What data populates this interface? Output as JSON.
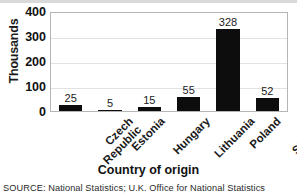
{
  "chart_data": {
    "type": "bar",
    "title": "",
    "categories": [
      "Czech Republic",
      "Estonia",
      "Hungary",
      "Lithuania",
      "Poland",
      "Slovakia"
    ],
    "category_lines": [
      [
        "Czech",
        "Republic"
      ],
      [
        "Estonia"
      ],
      [
        "Hungary"
      ],
      [
        "Lithuania"
      ],
      [
        "Poland"
      ],
      [
        "Slovakia"
      ]
    ],
    "values": [
      25,
      5,
      15,
      55,
      328,
      52
    ],
    "value_labels": [
      "25",
      "5",
      "15",
      "55",
      "328",
      "52"
    ],
    "xlabel": "Country of origin",
    "ylabel": "Thousands",
    "ylim": [
      0,
      400
    ],
    "yticks": [
      0,
      100,
      200,
      300,
      400
    ],
    "ytick_labels": [
      "0",
      "100",
      "200",
      "300",
      "400"
    ],
    "grid": true,
    "legend": false,
    "bar_color": "#0d0d0d",
    "plot_border_color": "#b5b5b5",
    "gridline_color": "#e2e2e2",
    "background_color": "#ffffff"
  },
  "footer": {
    "source": "SOURCE: National Statistics; U.K. Office for National Statistics"
  }
}
